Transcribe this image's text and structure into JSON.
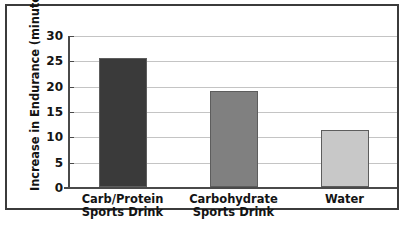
{
  "chart_data": {
    "type": "bar",
    "title": "",
    "xlabel": "",
    "ylabel": "Increase in Endurance (minutes)",
    "categories": [
      "Carb/Protein Sports Drink",
      "Carbohydrate Sports Drink",
      "Water"
    ],
    "category_lines": [
      [
        "Carb/Protein",
        "Sports Drink"
      ],
      [
        "Carbohydrate",
        "Sports Drink"
      ],
      [
        "Water",
        ""
      ]
    ],
    "values": [
      25.5,
      19.0,
      11.2
    ],
    "bar_colors": [
      "#3a3a3a",
      "#808080",
      "#c8c8c8"
    ],
    "bar_edge_color": "#5d5d5d",
    "ylim": [
      0,
      30
    ],
    "yticks": [
      0,
      5,
      10,
      15,
      20,
      25,
      30
    ],
    "ytick_labels": [
      "0",
      "5",
      "10",
      "15",
      "20",
      "25",
      "30"
    ],
    "grid": true,
    "grid_color": "#c4c4c4",
    "legend": null,
    "axis_color": "#4a4a4a",
    "frame_color": "#3b3b3b",
    "background": "#ffffff"
  }
}
